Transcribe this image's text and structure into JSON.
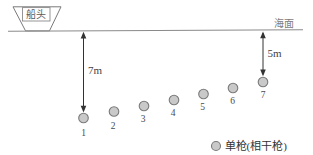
{
  "diagram": {
    "title_meaning": "Marine seismic source towing depth diagram",
    "ship_label": "船头",
    "sea_surface_label": "海面",
    "left_depth_label": "7m",
    "right_depth_label": "5m",
    "guns": [
      {
        "label": "1"
      },
      {
        "label": "2"
      },
      {
        "label": "3"
      },
      {
        "label": "4"
      },
      {
        "label": "5"
      },
      {
        "label": "6"
      },
      {
        "label": "7"
      }
    ],
    "legend": {
      "label": "单枪(相干枪)"
    },
    "colors": {
      "background": "#ffffff",
      "gun_fill": "#c9c9c9",
      "gun_stroke": "#7a7a7a",
      "sea_line": "#8a8a8a",
      "ship_outline": "#7a7a7a",
      "arrow": "#333333",
      "text": "#4a4a4a"
    }
  }
}
